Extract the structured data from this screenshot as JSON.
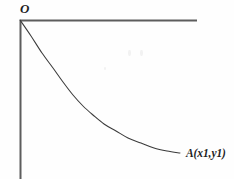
{
  "figure": {
    "kind": "math-curve-diagram",
    "background_color": "#fefefe",
    "ink_color": "#3a3a3a",
    "axis_color": "#5d5d5d",
    "labels": {
      "origin": "O",
      "point_a": "A(x1,y1)"
    }
  },
  "chart_data": {
    "type": "line",
    "title": "",
    "xlabel": "",
    "ylabel": "",
    "grid": false,
    "legend": null,
    "annotations": [
      {
        "name": "origin",
        "text": "O",
        "x_px": 20,
        "y_px": 20,
        "placement": "above-left-of-origin"
      },
      {
        "name": "point-a",
        "text": "A(x1,y1)",
        "x_px": 180,
        "y_px": 153,
        "placement": "right-of-curve-end"
      }
    ],
    "axes": {
      "vertical": {
        "name": "y-axis",
        "x_px": 20,
        "y_start_px": 20,
        "y_end_px": 179,
        "direction": "downward-from-origin"
      },
      "horizontal": {
        "name": "top-horizontal-line",
        "y_px": 20,
        "x_start_px": 20,
        "x_end_px": 197,
        "direction": "rightward-from-origin"
      }
    },
    "curve": {
      "name": "decaying-curve",
      "description": "monotonically decreasing convex curve from origin O steeply downward then flattening toward point A",
      "start_px": [
        20,
        20
      ],
      "end_px": [
        180,
        153
      ],
      "points_px": [
        [
          20,
          20
        ],
        [
          31,
          36
        ],
        [
          42,
          53
        ],
        [
          53,
          68
        ],
        [
          63,
          82
        ],
        [
          73,
          95
        ],
        [
          83,
          106
        ],
        [
          93,
          115
        ],
        [
          104,
          124
        ],
        [
          116,
          131
        ],
        [
          128,
          138
        ],
        [
          141,
          143
        ],
        [
          154,
          148
        ],
        [
          167,
          151
        ],
        [
          180,
          153
        ]
      ]
    }
  }
}
